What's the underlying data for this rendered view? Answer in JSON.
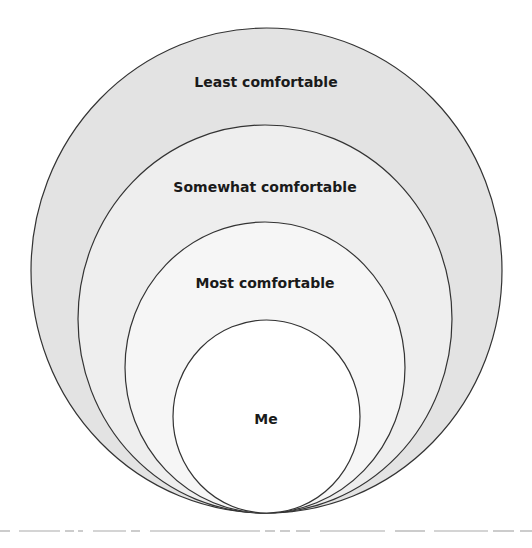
{
  "diagram": {
    "type": "nested-circles",
    "layers": [
      {
        "label": "Least comfortable",
        "fill": "#e3e3e3",
        "cx": 266.5,
        "cy": 270.5,
        "rx": 235.5,
        "ry": 242.5,
        "label_y": 87
      },
      {
        "label": "Somewhat comfortable",
        "fill": "#eeeeee",
        "cx": 265,
        "cy": 319,
        "rx": 187,
        "ry": 194,
        "label_y": 192
      },
      {
        "label": "Most comfortable",
        "fill": "#f6f6f6",
        "cx": 265,
        "cy": 367.5,
        "rx": 140,
        "ry": 145.5,
        "label_y": 288
      },
      {
        "label": "Me",
        "fill": "#ffffff",
        "cx": 266.5,
        "cy": 416.5,
        "rx": 93.5,
        "ry": 96.5,
        "label_y": 424
      }
    ],
    "stroke": "#333333",
    "baseline_color": "#aaaaaa"
  }
}
